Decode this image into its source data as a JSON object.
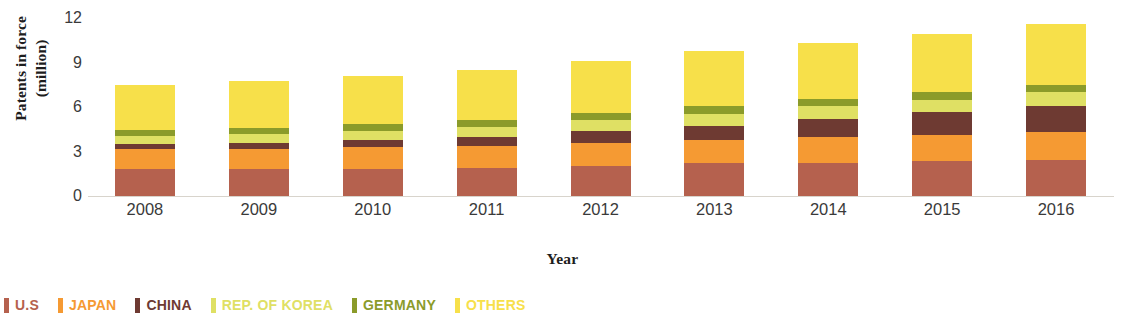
{
  "chart_data": {
    "type": "bar",
    "subtype": "stacked-bar",
    "title": "",
    "xlabel": "Year",
    "ylabel": "Patents in force\n(million)",
    "categories": [
      "2008",
      "2009",
      "2010",
      "2011",
      "2012",
      "2013",
      "2014",
      "2015",
      "2016"
    ],
    "ylim": [
      0,
      12
    ],
    "yticks": [
      0,
      3,
      6,
      9,
      12
    ],
    "ytick_labels": [
      "0",
      "3",
      "6",
      "9",
      "12"
    ],
    "grid": false,
    "legend_position": "bottom-left",
    "series": [
      {
        "name": "U.S",
        "color": "#b5614e",
        "values": [
          1.85,
          1.85,
          1.85,
          1.9,
          2.05,
          2.2,
          2.25,
          2.35,
          2.45
        ]
      },
      {
        "name": "JAPAN",
        "color": "#f59a33",
        "values": [
          1.3,
          1.35,
          1.45,
          1.5,
          1.55,
          1.6,
          1.7,
          1.75,
          1.85
        ]
      },
      {
        "name": "CHINA",
        "color": "#6e3a32",
        "values": [
          0.35,
          0.4,
          0.45,
          0.55,
          0.75,
          0.95,
          1.25,
          1.55,
          1.8
        ]
      },
      {
        "name": "REP. OF KOREA",
        "color": "#dfe064",
        "values": [
          0.55,
          0.6,
          0.65,
          0.7,
          0.75,
          0.8,
          0.85,
          0.85,
          0.9
        ]
      },
      {
        "name": "GERMANY",
        "color": "#8b9b2a",
        "values": [
          0.4,
          0.4,
          0.45,
          0.45,
          0.5,
          0.5,
          0.5,
          0.5,
          0.5
        ]
      },
      {
        "name": "OTHERS",
        "color": "#f7e04a",
        "values": [
          3.05,
          3.15,
          3.25,
          3.4,
          3.5,
          3.7,
          3.8,
          3.9,
          4.1
        ]
      }
    ],
    "totals": [
      7.5,
      7.75,
      8.1,
      8.5,
      9.1,
      9.75,
      10.35,
      10.9,
      11.6
    ]
  },
  "legend": {
    "items": [
      {
        "label": "U.S",
        "color": "#b5614e"
      },
      {
        "label": "JAPAN",
        "color": "#f59a33"
      },
      {
        "label": "CHINA",
        "color": "#6e3a32"
      },
      {
        "label": "REP. OF KOREA",
        "color": "#dfe064"
      },
      {
        "label": "GERMANY",
        "color": "#8b9b2a"
      },
      {
        "label": "OTHERS",
        "color": "#f7e04a"
      }
    ]
  },
  "axes": {
    "y_title": "Patents in force\n(million)",
    "x_title": "Year"
  }
}
